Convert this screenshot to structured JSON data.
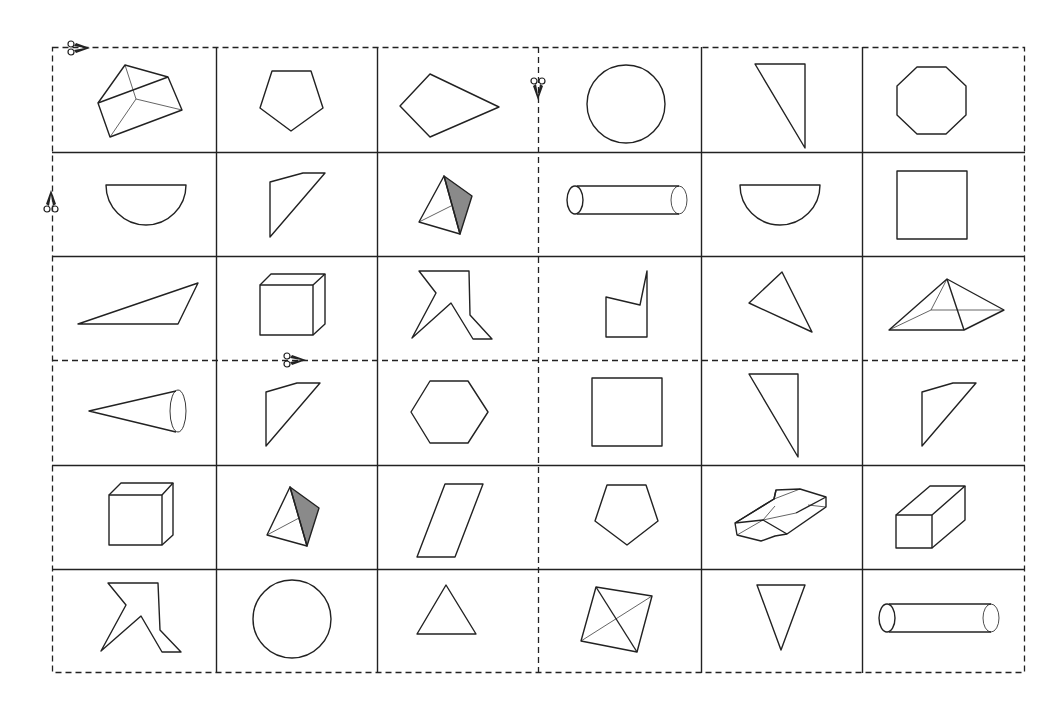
{
  "sheet": {
    "title": "Shape cut-out cards",
    "rows": 6,
    "cols": 6,
    "line_color": "#222222",
    "shade_color": "#8a8a8a",
    "cut_lines": {
      "vertical_dashed_between_cols": [
        3,
        4
      ],
      "horizontal_dashed_between_rows": [
        3,
        4
      ]
    },
    "scissors": [
      {
        "name": "scissors-top-left",
        "position": "top-left corner",
        "direction": "left"
      },
      {
        "name": "scissors-left-edge",
        "position": "left edge row 2",
        "direction": "down"
      },
      {
        "name": "scissors-center-vertical",
        "position": "center vertical cut, row 1",
        "direction": "down"
      },
      {
        "name": "scissors-middle-horizontal",
        "position": "middle horizontal cut, col 2",
        "direction": "left"
      }
    ]
  },
  "cards": [
    {
      "row": 1,
      "col": 1,
      "shape": "triangular-prism"
    },
    {
      "row": 1,
      "col": 2,
      "shape": "pentagon"
    },
    {
      "row": 1,
      "col": 3,
      "shape": "kite"
    },
    {
      "row": 1,
      "col": 4,
      "shape": "circle"
    },
    {
      "row": 1,
      "col": 5,
      "shape": "right-triangle"
    },
    {
      "row": 1,
      "col": 6,
      "shape": "octagon"
    },
    {
      "row": 2,
      "col": 1,
      "shape": "semicircle"
    },
    {
      "row": 2,
      "col": 2,
      "shape": "quadrilateral"
    },
    {
      "row": 2,
      "col": 3,
      "shape": "tetrahedron-shaded"
    },
    {
      "row": 2,
      "col": 4,
      "shape": "cylinder"
    },
    {
      "row": 2,
      "col": 5,
      "shape": "semicircle"
    },
    {
      "row": 2,
      "col": 6,
      "shape": "square"
    },
    {
      "row": 3,
      "col": 1,
      "shape": "obtuse-triangle"
    },
    {
      "row": 3,
      "col": 2,
      "shape": "cube"
    },
    {
      "row": 3,
      "col": 3,
      "shape": "irregular-polygon"
    },
    {
      "row": 3,
      "col": 4,
      "shape": "concave-pentagon"
    },
    {
      "row": 3,
      "col": 5,
      "shape": "scalene-triangle"
    },
    {
      "row": 3,
      "col": 6,
      "shape": "square-pyramid"
    },
    {
      "row": 4,
      "col": 1,
      "shape": "cone"
    },
    {
      "row": 4,
      "col": 2,
      "shape": "quadrilateral"
    },
    {
      "row": 4,
      "col": 3,
      "shape": "hexagon"
    },
    {
      "row": 4,
      "col": 4,
      "shape": "square"
    },
    {
      "row": 4,
      "col": 5,
      "shape": "right-triangle"
    },
    {
      "row": 4,
      "col": 6,
      "shape": "quadrilateral"
    },
    {
      "row": 5,
      "col": 1,
      "shape": "cube"
    },
    {
      "row": 5,
      "col": 2,
      "shape": "tetrahedron-shaded"
    },
    {
      "row": 5,
      "col": 3,
      "shape": "parallelogram"
    },
    {
      "row": 5,
      "col": 4,
      "shape": "pentagon"
    },
    {
      "row": 5,
      "col": 5,
      "shape": "hexagonal-prism"
    },
    {
      "row": 5,
      "col": 6,
      "shape": "rectangular-prism"
    },
    {
      "row": 6,
      "col": 1,
      "shape": "irregular-polygon"
    },
    {
      "row": 6,
      "col": 2,
      "shape": "circle"
    },
    {
      "row": 6,
      "col": 3,
      "shape": "equilateral-triangle"
    },
    {
      "row": 6,
      "col": 4,
      "shape": "square-pyramid-top-view"
    },
    {
      "row": 6,
      "col": 5,
      "shape": "inverted-triangle"
    },
    {
      "row": 6,
      "col": 6,
      "shape": "cylinder"
    }
  ]
}
